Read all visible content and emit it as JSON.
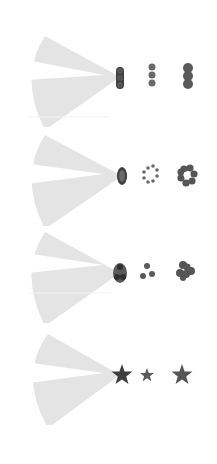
{
  "colors": {
    "background": "#ffffff",
    "cone": "#e4e4e4",
    "wedge": "#ffffff",
    "shape_dark": "#4a4a4a",
    "shape_mid": "#5e5e5e",
    "shape_light": "#6e6e6e",
    "apex_fill": "#8a8a8a"
  },
  "rows": [
    {
      "id": "dots-vertical",
      "center_y": 77,
      "apex_shape": "three-dots-vertical",
      "icon_a": "three-dots-small-vertical",
      "icon_b": "three-dots-large-vertical"
    },
    {
      "id": "ring",
      "center_y": 176,
      "apex_shape": "dotted-ring-oval",
      "icon_a": "dotted-ring",
      "icon_b": "flower-ring"
    },
    {
      "id": "triangle-cluster",
      "center_y": 273,
      "apex_shape": "three-dot-cluster-oval",
      "icon_a": "three-dot-cluster-small",
      "icon_b": "three-blob-cluster"
    },
    {
      "id": "star",
      "center_y": 375,
      "apex_shape": "star",
      "icon_a": "star-small",
      "icon_b": "star-large"
    }
  ]
}
